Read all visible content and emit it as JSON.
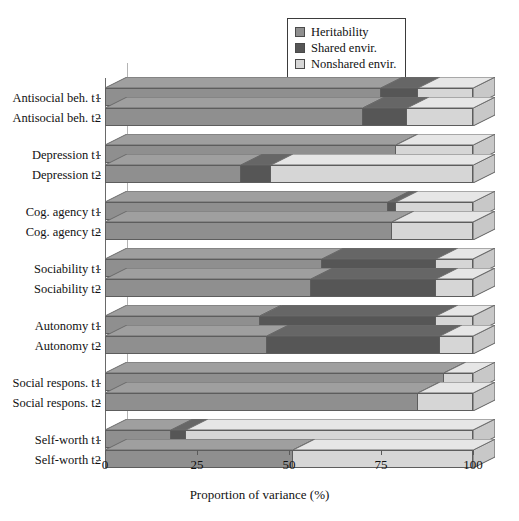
{
  "chart_data": {
    "type": "bar",
    "orientation": "horizontal",
    "stacked": true,
    "title": "",
    "xlabel": "Proportion of variance (%)",
    "ylabel": "",
    "xlim": [
      0,
      100
    ],
    "xticks": [
      0,
      25,
      50,
      75,
      100
    ],
    "xticklabels": [
      "0",
      "25",
      "50",
      "75",
      "100"
    ],
    "grid": false,
    "legend_position": "top-right",
    "categories": [
      "Antisocial beh. t1",
      "Antisocial beh. t2",
      "Depression t1",
      "Depression t2",
      "Cog. agency t1",
      "Cog. agency t2",
      "Sociability t1",
      "Sociability t2",
      "Autonomy t1",
      "Autonomy t2",
      "Social respons. t1",
      "Social respons. t2",
      "Self-worth t1",
      "Self-worth t2"
    ],
    "series": [
      {
        "name": "Heritability",
        "color": "#8f8f8f",
        "values": [
          75,
          70,
          79,
          37,
          77,
          78,
          59,
          56,
          42,
          44,
          92,
          85,
          18,
          51
        ]
      },
      {
        "name": "Shared envir.",
        "color": "#565656",
        "values": [
          10,
          12,
          0,
          8,
          2,
          0,
          31,
          34,
          48,
          47,
          0,
          0,
          4,
          0
        ]
      },
      {
        "name": "Nonshared envir.",
        "color": "#d6d6d6",
        "values": [
          15,
          18,
          21,
          55,
          21,
          22,
          10,
          10,
          10,
          9,
          8,
          15,
          78,
          49
        ]
      }
    ],
    "groups": [
      {
        "name": "Antisocial beh.",
        "rows": [
          0,
          1
        ]
      },
      {
        "name": "Depression",
        "rows": [
          2,
          3
        ]
      },
      {
        "name": "Cog. agency",
        "rows": [
          4,
          5
        ]
      },
      {
        "name": "Sociability",
        "rows": [
          6,
          7
        ]
      },
      {
        "name": "Autonomy",
        "rows": [
          8,
          9
        ]
      },
      {
        "name": "Social respons.",
        "rows": [
          10,
          11
        ]
      },
      {
        "name": "Self-worth",
        "rows": [
          12,
          13
        ]
      }
    ]
  },
  "legend": {
    "items": [
      {
        "label": "Heritability",
        "color": "#8f8f8f"
      },
      {
        "label": "Shared envir.",
        "color": "#565656"
      },
      {
        "label": "Nonshared envir.",
        "color": "#d6d6d6"
      }
    ]
  },
  "axis": {
    "x_title": "Proportion of variance (%)",
    "tick_labels": [
      "0",
      "25",
      "50",
      "75",
      "100"
    ]
  },
  "colors": {
    "heritability": "#8f8f8f",
    "shared": "#565656",
    "nonshared": "#d6d6d6",
    "outline": "#5d5d5d",
    "background": "#ffffff"
  }
}
